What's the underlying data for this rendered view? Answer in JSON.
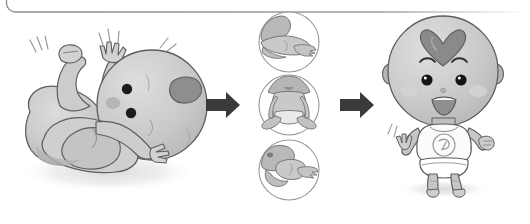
{
  "figure": {
    "title_visible": false,
    "type": "illustration",
    "orientation": "left-to-right progression",
    "background_color": "#ffffff",
    "frame": {
      "name": "rounded-panel-border",
      "description": "thin rounded-rectangle outline clipped at top edge of image",
      "stroke_color": "#8c8c8c",
      "stroke_width": 1.2,
      "corner_radius": 9,
      "x": 6,
      "y": -32,
      "width": 520,
      "height": 44
    },
    "panels": [
      {
        "id": "stage-1",
        "name": "newborn-lying-on-back",
        "label_text": "",
        "position": {
          "x": 14,
          "y": 22,
          "width": 185,
          "height": 170
        },
        "description": "large newborn baby lying on its back with arms raised and legs tucked, motion lines beside arms",
        "skin_color": "#c6c6c6",
        "outline_color": "#59595b",
        "hair_patch_color": "#8e8e90",
        "shadow_color": "#eaeaea",
        "has_motion_lines": true,
        "motion_line_count": 4
      },
      {
        "id": "stage-2",
        "name": "circle-panel-stack",
        "label_text": "",
        "position": {
          "x": 252,
          "y": 12,
          "width": 76,
          "height": 200
        },
        "circles": [
          {
            "id": "circle-1",
            "name": "baby-lying-prone-tummy-time",
            "center": {
              "cx": 289,
              "cy": 42
            },
            "radius": 30,
            "description": "baby lying prone on tummy, head lifted"
          },
          {
            "id": "circle-2",
            "name": "baby-sitting-upright",
            "center": {
              "cx": 289,
              "cy": 105
            },
            "radius": 30,
            "description": "baby sitting upright wearing a diaper, legs forward"
          },
          {
            "id": "circle-3",
            "name": "baby-crawling",
            "center": {
              "cx": 289,
              "cy": 170
            },
            "radius": 30,
            "description": "baby crawling on hands and knees"
          }
        ],
        "circle_stroke_color": "#9a9a9a",
        "circle_fill_color": "#ffffff",
        "body_fill_color": "#c9c9c9"
      },
      {
        "id": "stage-3",
        "name": "toddler-standing",
        "label_text": "",
        "position": {
          "x": 382,
          "y": 16,
          "width": 128,
          "height": 190
        },
        "description": "smiling toddler standing upright, wearing white shirt with round emblem and a diaper, arms raised, heart-shaped hair tuft on head",
        "skin_color": "#c8c8c8",
        "outline_color": "#5d5d5f",
        "hair_color": "#8a8a8c",
        "hair_shape": "heart",
        "shirt_color": "#fbfbfb",
        "shirt_emblem": "circular-logo",
        "diaper_color": "#ffffff",
        "cheek_blush_color": "#dadada",
        "has_motion_lines": true,
        "shadow_color": "#ececec"
      }
    ],
    "arrows": [
      {
        "id": "arrow-1",
        "name": "progression-arrow-left",
        "direction": "right",
        "color": "#3a3a3a",
        "x": 206,
        "y": 92,
        "width": 34,
        "height": 26
      },
      {
        "id": "arrow-2",
        "name": "progression-arrow-right",
        "direction": "right",
        "color": "#3a3a3a",
        "x": 340,
        "y": 92,
        "width": 34,
        "height": 26
      }
    ]
  }
}
